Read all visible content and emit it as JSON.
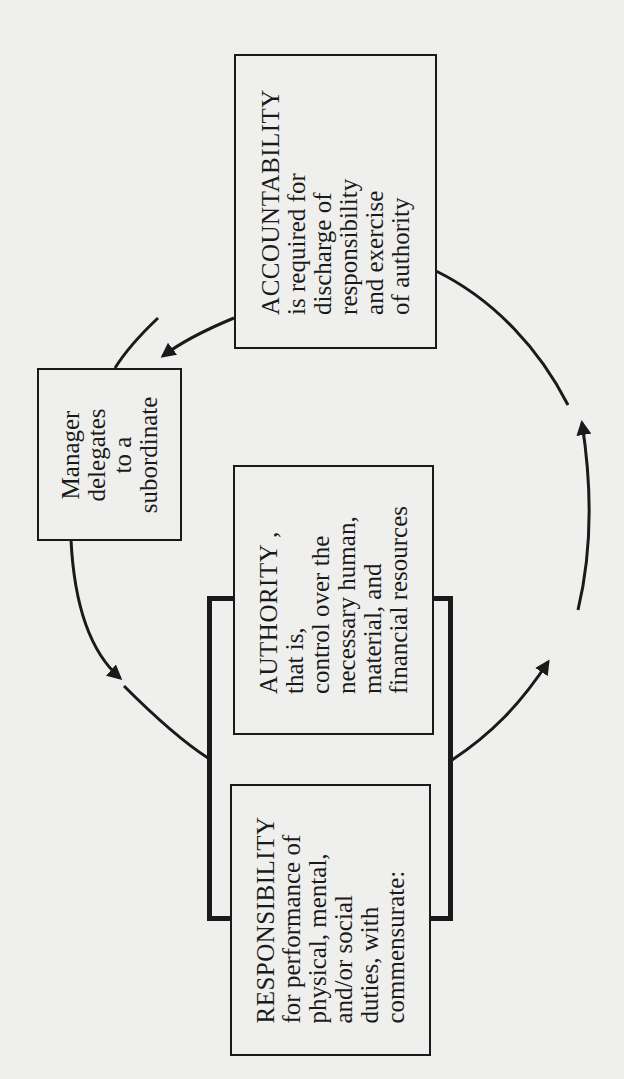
{
  "diagram": {
    "type": "cycle",
    "orientation": "rotated -90deg",
    "colors": {
      "ink": "#1a1a1a",
      "paper": "#efefed"
    },
    "nodes": {
      "accountability": {
        "title": "ACCOUNTABILITY",
        "lines": [
          "is required for",
          "discharge of",
          "responsibility",
          "and exercise",
          "of authority"
        ]
      },
      "manager": {
        "lines": [
          "Manager",
          "delegates",
          "to a",
          "subordinate"
        ]
      },
      "authority": {
        "title": "AUTHORITY ,",
        "lines": [
          "that is,",
          "control over the",
          "necessary human,",
          "material, and",
          "financial resources"
        ]
      },
      "responsibility": {
        "title": "RESPONSIBILITY",
        "lines": [
          "for performance of",
          "physical, mental,",
          "and/or social",
          "duties, with",
          "commensurate:"
        ]
      }
    },
    "edges": [
      {
        "from": "accountability",
        "to": "manager",
        "arrow": "arrow-head"
      },
      {
        "from": "manager",
        "to": "responsibility",
        "arrow": "arrow-head"
      },
      {
        "from": "responsibility",
        "to": "accountability",
        "arrow": "arrow-head",
        "count": 2
      }
    ],
    "bracket": {
      "groups": [
        "authority",
        "responsibility"
      ]
    }
  }
}
